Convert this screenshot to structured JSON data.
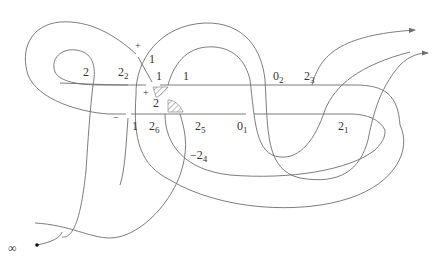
{
  "diagram": {
    "type": "knot-diagram",
    "infinity_label": "∞",
    "labels": [
      {
        "id": "l-2-left",
        "text": "2",
        "sub": "",
        "x": 83,
        "y": 76
      },
      {
        "id": "l-2-2",
        "text": "2",
        "sub": "2",
        "x": 118,
        "y": 76
      },
      {
        "id": "l-1-top",
        "text": "1",
        "sub": "",
        "x": 149,
        "y": 63
      },
      {
        "id": "l-1-a",
        "text": "1",
        "sub": "",
        "x": 156,
        "y": 80
      },
      {
        "id": "l-1-b",
        "text": "1",
        "sub": "",
        "x": 183,
        "y": 80
      },
      {
        "id": "l-0-2",
        "text": "0",
        "sub": "2",
        "x": 273,
        "y": 80
      },
      {
        "id": "l-2-3",
        "text": "2",
        "sub": "3",
        "x": 304,
        "y": 80
      },
      {
        "id": "l-2-mid",
        "text": "2",
        "sub": "",
        "x": 153,
        "y": 107
      },
      {
        "id": "l-1-low",
        "text": "1",
        "sub": "",
        "x": 132,
        "y": 130
      },
      {
        "id": "l-2-6",
        "text": "2",
        "sub": "6",
        "x": 149,
        "y": 130
      },
      {
        "id": "l-2-5",
        "text": "2",
        "sub": "5",
        "x": 195,
        "y": 130
      },
      {
        "id": "l-0-1",
        "text": "0",
        "sub": "1",
        "x": 237,
        "y": 130
      },
      {
        "id": "l-2-1",
        "text": "2",
        "sub": "1",
        "x": 338,
        "y": 130
      },
      {
        "id": "l-neg-2-4",
        "text": "−2",
        "sub": "4",
        "x": 190,
        "y": 159
      }
    ],
    "signs": [
      {
        "id": "sign-plus-top",
        "text": "+",
        "x": 135,
        "y": 49
      },
      {
        "id": "sign-plus-mid",
        "text": "+",
        "x": 143,
        "y": 96
      },
      {
        "id": "sign-minus",
        "text": "−",
        "x": 113,
        "y": 121
      }
    ],
    "colors": {
      "stroke": "#6e6e6e",
      "text": "#333333"
    }
  }
}
